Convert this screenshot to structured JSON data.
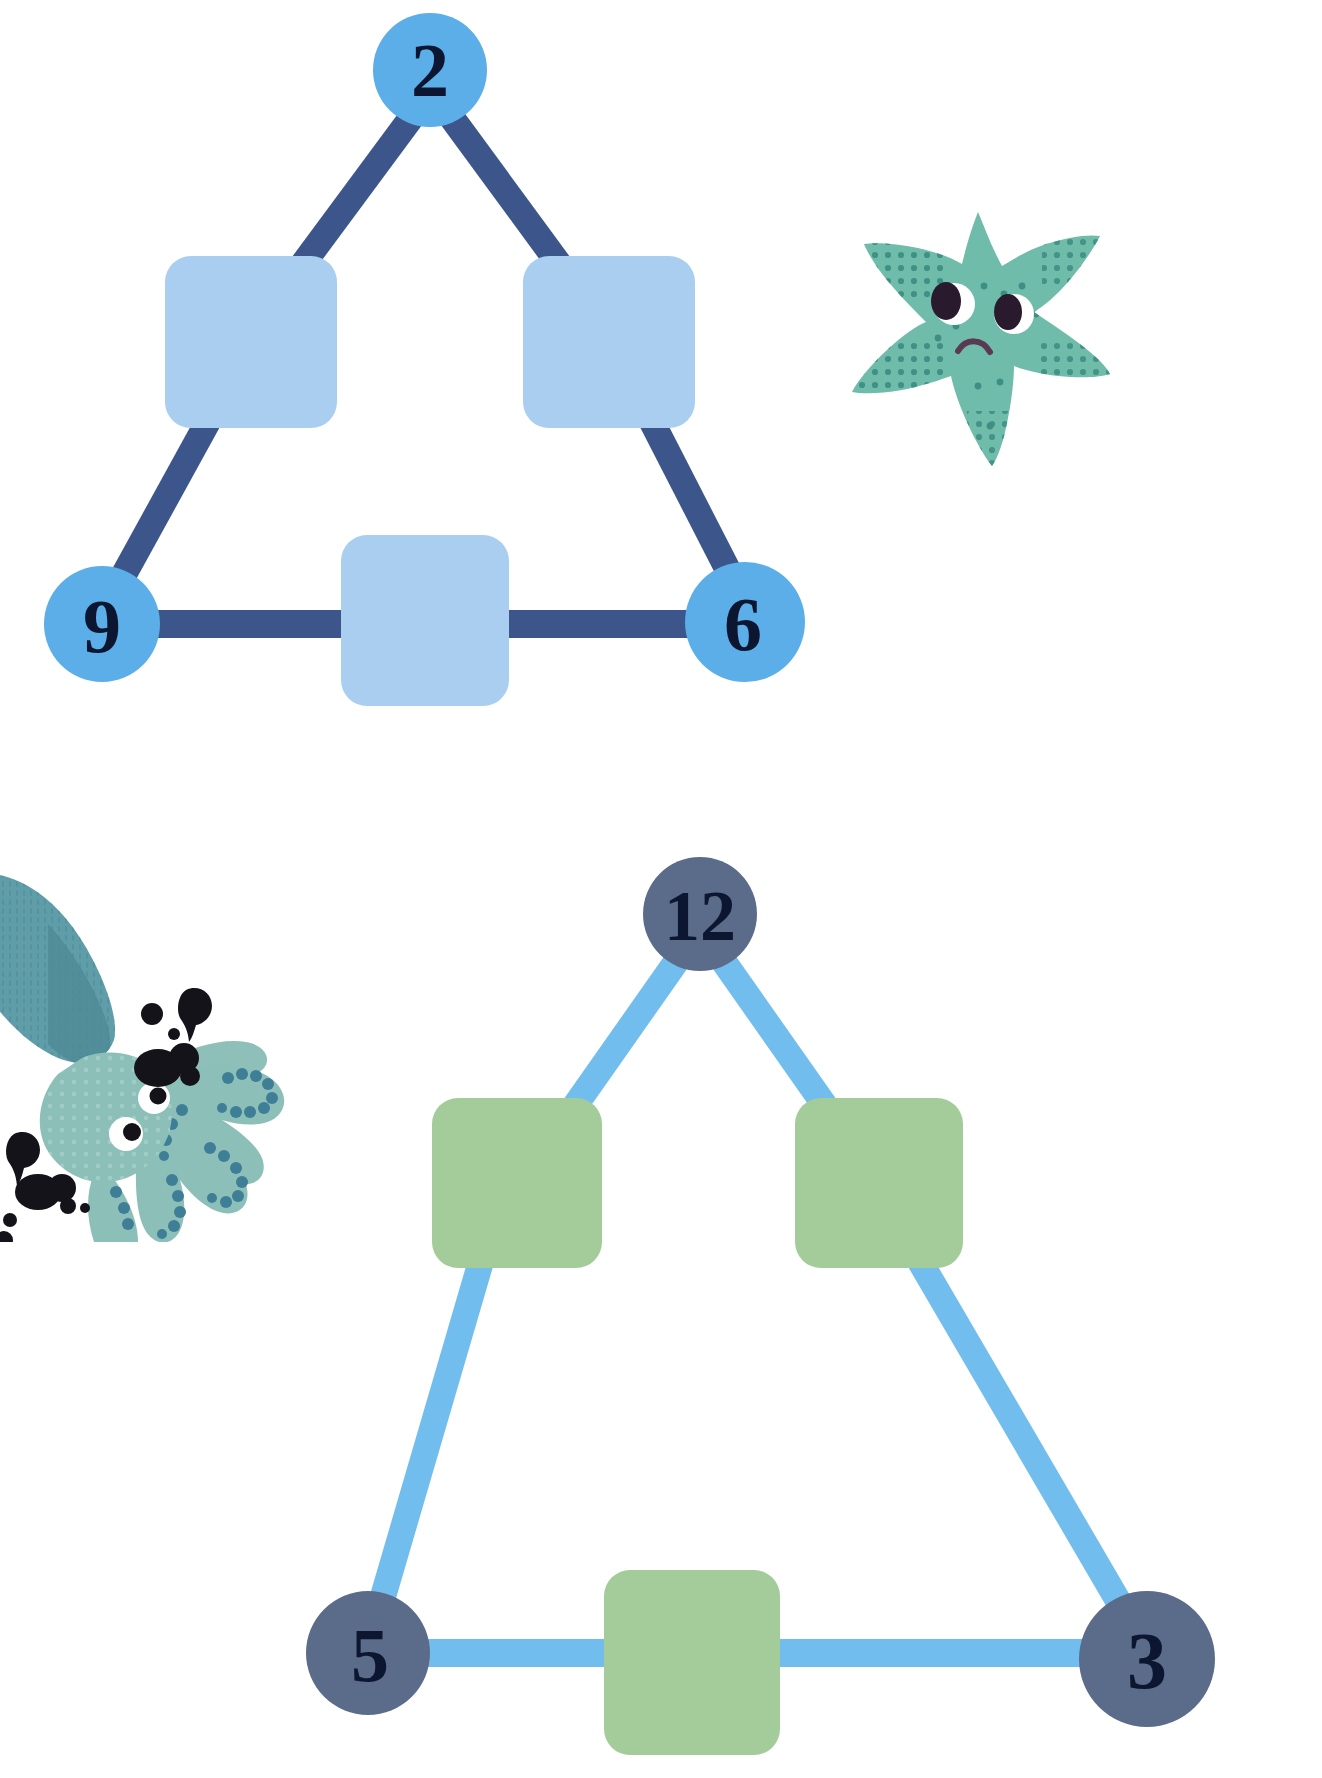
{
  "page": {
    "background_color": "#ffffff",
    "width": 1322,
    "height": 1778
  },
  "puzzles": [
    {
      "id": "puzzle-top",
      "name": "blue-triangle-puzzle",
      "theme": {
        "circle_fill": "#5BAEE8",
        "square_fill": "#A9CEF0",
        "edge_color": "#3C558A",
        "number_color": "#0d1630"
      },
      "circles": [
        {
          "name": "node-circle-top",
          "value": "2",
          "cx": 430,
          "cy": 70,
          "r": 57
        },
        {
          "name": "node-circle-bottom-left",
          "value": "9",
          "cx": 102,
          "cy": 624,
          "r": 58
        },
        {
          "name": "node-circle-bottom-right",
          "value": "6",
          "cx": 745,
          "cy": 622,
          "r": 60
        }
      ],
      "squares": [
        {
          "name": "answer-box-left",
          "value": "",
          "x": 165,
          "y": 256,
          "w": 172,
          "h": 172
        },
        {
          "name": "answer-box-right",
          "value": "",
          "x": 523,
          "y": 256,
          "w": 172,
          "h": 172
        },
        {
          "name": "answer-box-bottom",
          "value": "",
          "x": 341,
          "y": 535,
          "w": 168,
          "h": 171
        }
      ],
      "edges": [
        {
          "name": "edge-top-to-left",
          "from": "node-circle-top",
          "to": "answer-box-left"
        },
        {
          "name": "edge-top-to-right",
          "from": "node-circle-top",
          "to": "answer-box-right"
        },
        {
          "name": "edge-left-to-bottomleft",
          "from": "answer-box-left",
          "to": "node-circle-bottom-left"
        },
        {
          "name": "edge-right-to-bottomright",
          "from": "answer-box-right",
          "to": "node-circle-bottom-right"
        },
        {
          "name": "edge-bottomleft-to-bottombox",
          "from": "node-circle-bottom-left",
          "to": "answer-box-bottom"
        },
        {
          "name": "edge-bottombox-to-bottomright",
          "from": "answer-box-bottom",
          "to": "node-circle-bottom-right"
        }
      ]
    },
    {
      "id": "puzzle-bottom",
      "name": "green-triangle-puzzle",
      "theme": {
        "circle_fill": "#5B6B8A",
        "square_fill": "#A4CC9B",
        "edge_color": "#71BDEE",
        "number_color": "#0d1630"
      },
      "circles": [
        {
          "name": "node-circle-top",
          "value": "12",
          "cx": 700,
          "cy": 914,
          "r": 57
        },
        {
          "name": "node-circle-bottom-left",
          "value": "5",
          "cx": 368,
          "cy": 1653,
          "r": 62
        },
        {
          "name": "node-circle-bottom-right",
          "value": "3",
          "cx": 1147,
          "cy": 1659,
          "r": 68
        }
      ],
      "squares": [
        {
          "name": "answer-box-left",
          "value": "",
          "x": 432,
          "y": 1098,
          "w": 170,
          "h": 170
        },
        {
          "name": "answer-box-right",
          "value": "",
          "x": 795,
          "y": 1098,
          "w": 168,
          "h": 170
        },
        {
          "name": "answer-box-bottom",
          "value": "",
          "x": 604,
          "y": 1570,
          "w": 176,
          "h": 180
        }
      ],
      "edges": [
        {
          "name": "edge-top-to-left",
          "from": "node-circle-top",
          "to": "answer-box-left"
        },
        {
          "name": "edge-top-to-right",
          "from": "node-circle-top",
          "to": "answer-box-right"
        },
        {
          "name": "edge-left-to-bottomleft",
          "from": "answer-box-left",
          "to": "node-circle-bottom-left"
        },
        {
          "name": "edge-right-to-bottomright",
          "from": "answer-box-right",
          "to": "node-circle-bottom-right"
        },
        {
          "name": "edge-bottomleft-to-bottombox",
          "from": "node-circle-bottom-left",
          "to": "answer-box-bottom"
        },
        {
          "name": "edge-bottombox-to-bottomright",
          "from": "answer-box-bottom",
          "to": "node-circle-bottom-right"
        }
      ]
    }
  ],
  "decorations": [
    {
      "name": "starfish-illustration",
      "subject": "starfish",
      "expression": "sad",
      "colors": {
        "body": "#6FBCAB",
        "dots": "#3E8F83",
        "eye_white": "#ffffff",
        "pupil": "#2A1A2E",
        "mouth": "#5A3A52"
      },
      "position": {
        "x": 832,
        "y": 186,
        "w": 310,
        "h": 320
      }
    },
    {
      "name": "squid-illustration",
      "subject": "squid",
      "colors": {
        "mantle": "#5F9EA8",
        "mantle_shadow": "#4E8A96",
        "head": "#8CBFB8",
        "tentacle": "#8CBFB8",
        "suckers": "#3E7E96",
        "ink": "#15131A",
        "eye_white": "#ffffff",
        "pupil": "#15131A"
      },
      "position": {
        "x": -14,
        "y": 862,
        "w": 300,
        "h": 380
      }
    }
  ]
}
